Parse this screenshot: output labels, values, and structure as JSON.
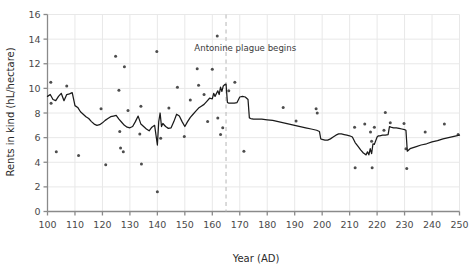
{
  "chart_data": {
    "type": "scatter",
    "title": "",
    "xlabel": "Year (AD)",
    "ylabel": "Rents in kind (hL/hectare)",
    "xlim": [
      100,
      250
    ],
    "ylim": [
      0,
      16
    ],
    "xticks": [
      100,
      110,
      120,
      130,
      140,
      150,
      160,
      170,
      180,
      190,
      200,
      210,
      220,
      230,
      240,
      250
    ],
    "yticks": [
      0,
      2,
      4,
      6,
      8,
      10,
      12,
      14,
      16
    ],
    "grid": true,
    "legend": "none",
    "colors": {
      "point": "#4d4d4d",
      "line": "#1a1a1a",
      "grid": "#e8e8e8",
      "axis": "#8a8a8a",
      "text": "#3a3a3a",
      "annotation_line": "#bcbcbc"
    },
    "annotations": [
      {
        "name": "antonine-plague",
        "text": "Antonine plague begins",
        "x": 165,
        "label_x": 172,
        "label_y": 13.05,
        "line_style": "dashed",
        "line_y_from": 0,
        "line_y_to": 16
      }
    ],
    "series": [
      {
        "name": "rents-scatter",
        "type": "scatter",
        "points": [
          [
            101.2,
            10.5
          ],
          [
            101.3,
            8.8
          ],
          [
            103.2,
            4.85
          ],
          [
            107.0,
            10.2
          ],
          [
            111.3,
            4.55
          ],
          [
            119.5,
            8.35
          ],
          [
            121.2,
            3.8
          ],
          [
            124.8,
            12.6
          ],
          [
            126.0,
            9.85
          ],
          [
            126.3,
            6.5
          ],
          [
            126.6,
            5.15
          ],
          [
            127.6,
            4.85
          ],
          [
            128.0,
            11.75
          ],
          [
            129.3,
            8.2
          ],
          [
            133.6,
            6.3
          ],
          [
            134.0,
            8.55
          ],
          [
            134.2,
            3.85
          ],
          [
            139.8,
            13.0
          ],
          [
            140.0,
            1.6
          ],
          [
            141.2,
            5.95
          ],
          [
            144.2,
            8.4
          ],
          [
            147.3,
            10.1
          ],
          [
            149.8,
            6.1
          ],
          [
            152.0,
            9.05
          ],
          [
            154.5,
            11.6
          ],
          [
            155.0,
            10.25
          ],
          [
            157.0,
            9.5
          ],
          [
            158.3,
            7.3
          ],
          [
            160.0,
            11.55
          ],
          [
            161.8,
            14.25
          ],
          [
            162.0,
            7.6
          ],
          [
            163.0,
            6.25
          ],
          [
            163.8,
            6.8
          ],
          [
            166.0,
            9.8
          ],
          [
            168.2,
            10.5
          ],
          [
            171.5,
            4.9
          ],
          [
            185.8,
            8.45
          ],
          [
            190.5,
            7.35
          ],
          [
            197.8,
            8.35
          ],
          [
            198.2,
            8.0
          ],
          [
            211.8,
            6.85
          ],
          [
            212.0,
            3.55
          ],
          [
            215.5,
            7.1
          ],
          [
            217.6,
            6.45
          ],
          [
            218.0,
            5.7
          ],
          [
            218.2,
            3.55
          ],
          [
            219.0,
            6.85
          ],
          [
            222.5,
            6.6
          ],
          [
            223.0,
            8.05
          ],
          [
            224.8,
            7.2
          ],
          [
            229.8,
            7.15
          ],
          [
            230.5,
            5.1
          ],
          [
            230.8,
            3.5
          ],
          [
            237.5,
            6.45
          ],
          [
            244.5,
            7.1
          ],
          [
            249.5,
            6.25
          ]
        ]
      },
      {
        "name": "rents-trend-line",
        "type": "line",
        "points": [
          [
            100.0,
            9.35
          ],
          [
            101.0,
            9.5
          ],
          [
            102.0,
            9.1
          ],
          [
            103.0,
            9.0
          ],
          [
            104.0,
            9.35
          ],
          [
            105.0,
            9.6
          ],
          [
            106.0,
            9.0
          ],
          [
            107.0,
            9.5
          ],
          [
            108.0,
            9.55
          ],
          [
            109.0,
            9.65
          ],
          [
            110.0,
            8.6
          ],
          [
            111.0,
            8.45
          ],
          [
            112.0,
            8.1
          ],
          [
            113.0,
            7.9
          ],
          [
            114.0,
            7.7
          ],
          [
            115.0,
            7.55
          ],
          [
            116.0,
            7.3
          ],
          [
            117.0,
            7.1
          ],
          [
            118.0,
            7.0
          ],
          [
            119.0,
            7.05
          ],
          [
            120.0,
            7.2
          ],
          [
            121.0,
            7.4
          ],
          [
            122.0,
            7.55
          ],
          [
            123.0,
            7.7
          ],
          [
            124.0,
            7.75
          ],
          [
            125.0,
            7.8
          ],
          [
            126.0,
            7.5
          ],
          [
            127.0,
            7.25
          ],
          [
            128.0,
            7.0
          ],
          [
            129.0,
            6.85
          ],
          [
            130.0,
            6.8
          ],
          [
            131.0,
            6.9
          ],
          [
            132.0,
            7.3
          ],
          [
            133.0,
            7.75
          ],
          [
            134.0,
            7.1
          ],
          [
            135.0,
            6.9
          ],
          [
            136.0,
            6.7
          ],
          [
            137.0,
            6.55
          ],
          [
            138.0,
            6.85
          ],
          [
            139.0,
            7.0
          ],
          [
            140.0,
            5.4
          ],
          [
            140.5,
            7.3
          ],
          [
            141.0,
            8.0
          ],
          [
            141.5,
            6.9
          ],
          [
            142.0,
            7.15
          ],
          [
            143.0,
            6.9
          ],
          [
            144.0,
            6.75
          ],
          [
            145.0,
            6.8
          ],
          [
            146.0,
            7.3
          ],
          [
            147.0,
            7.9
          ],
          [
            148.0,
            7.75
          ],
          [
            149.0,
            7.3
          ],
          [
            150.0,
            6.9
          ],
          [
            151.0,
            7.3
          ],
          [
            152.0,
            7.65
          ],
          [
            153.0,
            7.9
          ],
          [
            154.0,
            8.15
          ],
          [
            155.0,
            8.4
          ],
          [
            156.0,
            8.55
          ],
          [
            157.0,
            8.7
          ],
          [
            158.0,
            8.95
          ],
          [
            159.0,
            9.2
          ],
          [
            160.0,
            9.15
          ],
          [
            160.5,
            9.6
          ],
          [
            161.0,
            9.35
          ],
          [
            162.0,
            9.8
          ],
          [
            162.5,
            9.5
          ],
          [
            163.0,
            10.1
          ],
          [
            163.5,
            9.75
          ],
          [
            164.0,
            10.2
          ],
          [
            164.5,
            10.3
          ],
          [
            165.0,
            10.35
          ],
          [
            165.5,
            8.85
          ],
          [
            166.0,
            8.8
          ],
          [
            167.0,
            8.8
          ],
          [
            168.0,
            8.8
          ],
          [
            169.0,
            8.85
          ],
          [
            170.0,
            9.3
          ],
          [
            171.0,
            9.35
          ],
          [
            172.0,
            9.3
          ],
          [
            173.0,
            9.1
          ],
          [
            173.5,
            7.6
          ],
          [
            174.0,
            7.55
          ],
          [
            175.0,
            7.5
          ],
          [
            176.0,
            7.5
          ],
          [
            178.0,
            7.5
          ],
          [
            180.0,
            7.45
          ],
          [
            182.0,
            7.4
          ],
          [
            184.0,
            7.3
          ],
          [
            186.0,
            7.2
          ],
          [
            188.0,
            7.1
          ],
          [
            190.0,
            7.0
          ],
          [
            192.0,
            6.9
          ],
          [
            194.0,
            6.8
          ],
          [
            196.0,
            6.7
          ],
          [
            198.0,
            6.6
          ],
          [
            199.0,
            6.5
          ],
          [
            199.5,
            5.9
          ],
          [
            200.0,
            5.85
          ],
          [
            201.0,
            5.8
          ],
          [
            202.0,
            5.8
          ],
          [
            203.0,
            5.9
          ],
          [
            204.0,
            6.05
          ],
          [
            205.0,
            6.2
          ],
          [
            206.0,
            6.3
          ],
          [
            207.0,
            6.3
          ],
          [
            208.0,
            6.25
          ],
          [
            209.0,
            6.2
          ],
          [
            210.0,
            6.15
          ],
          [
            211.0,
            6.05
          ],
          [
            212.0,
            5.6
          ],
          [
            213.0,
            5.3
          ],
          [
            214.0,
            5.0
          ],
          [
            215.0,
            4.75
          ],
          [
            216.0,
            4.6
          ],
          [
            216.5,
            4.85
          ],
          [
            217.0,
            4.6
          ],
          [
            217.5,
            5.1
          ],
          [
            218.0,
            4.7
          ],
          [
            218.5,
            5.5
          ],
          [
            219.0,
            5.45
          ],
          [
            220.0,
            6.05
          ],
          [
            220.5,
            6.15
          ],
          [
            221.0,
            6.15
          ],
          [
            222.0,
            6.2
          ],
          [
            223.0,
            6.2
          ],
          [
            224.0,
            6.25
          ],
          [
            224.5,
            6.9
          ],
          [
            225.0,
            6.85
          ],
          [
            226.0,
            6.8
          ],
          [
            227.0,
            6.8
          ],
          [
            228.0,
            6.75
          ],
          [
            229.0,
            6.7
          ],
          [
            230.0,
            6.65
          ],
          [
            230.5,
            6.6
          ],
          [
            231.0,
            4.9
          ],
          [
            232.0,
            5.1
          ],
          [
            234.0,
            5.25
          ],
          [
            236.0,
            5.4
          ],
          [
            238.0,
            5.5
          ],
          [
            240.0,
            5.65
          ],
          [
            242.0,
            5.75
          ],
          [
            244.0,
            5.9
          ],
          [
            246.0,
            6.0
          ],
          [
            248.0,
            6.1
          ],
          [
            250.0,
            6.2
          ]
        ]
      }
    ]
  }
}
